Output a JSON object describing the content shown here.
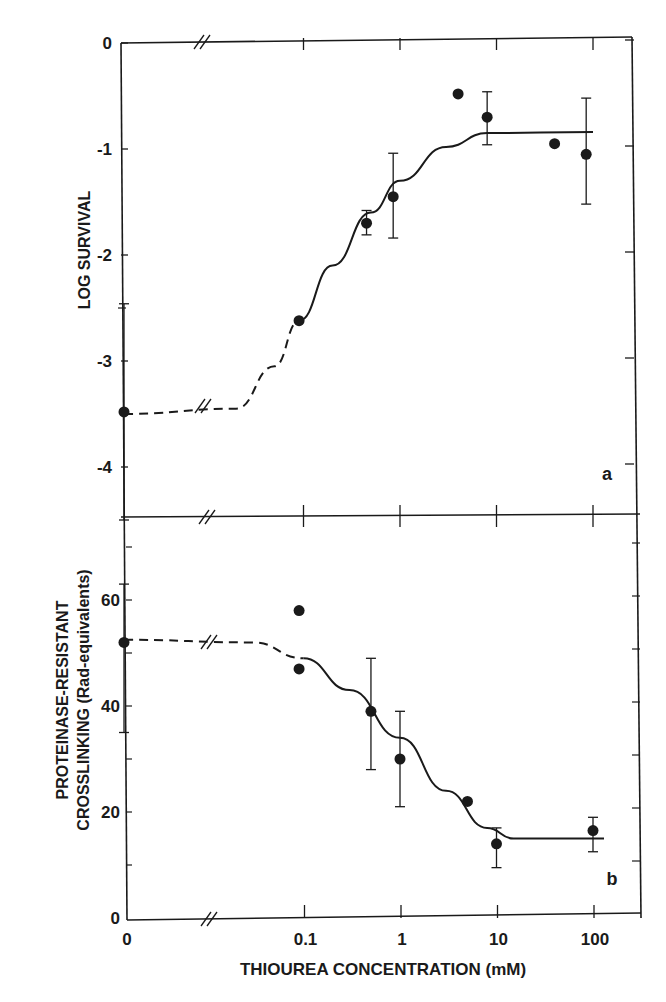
{
  "chart_data": [
    {
      "type": "scatter",
      "panel": "a",
      "title": "",
      "xlabel": "THIOUREA CONCENTRATION (mM)",
      "ylabel": "LOG SURVIVAL",
      "x_scale": "log with broken axis (0 shown separately)",
      "x_ticks": [
        "0",
        "0.1",
        "1",
        "10",
        "100"
      ],
      "y_ticks": [
        "0",
        "-1",
        "-2",
        "-3",
        "-4"
      ],
      "ylim": [
        -4.5,
        0
      ],
      "grid": false,
      "legend": null,
      "series": [
        {
          "name": "data",
          "points": [
            {
              "x": 0,
              "y": -3.48,
              "err_high": -2.46,
              "err_low": -4.5
            },
            {
              "x": 0.09,
              "y": -2.62
            },
            {
              "x": 0.45,
              "y": -1.7,
              "err_high": -1.58,
              "err_low": -1.81
            },
            {
              "x": 0.85,
              "y": -1.45,
              "err_high": -1.04,
              "err_low": -1.84
            },
            {
              "x": 4,
              "y": -0.48
            },
            {
              "x": 8,
              "y": -0.7,
              "err_high": -0.46,
              "err_low": -0.96
            },
            {
              "x": 40,
              "y": -0.95
            },
            {
              "x": 85,
              "y": -1.05,
              "err_high": -0.52,
              "err_low": -1.52
            }
          ]
        },
        {
          "name": "fit curve",
          "style": "dashed below x=0.09, solid above",
          "points": [
            {
              "x": 0,
              "y": -3.5
            },
            {
              "x": 0.02,
              "y": -3.45
            },
            {
              "x": 0.05,
              "y": -3.05
            },
            {
              "x": 0.09,
              "y": -2.62
            },
            {
              "x": 0.2,
              "y": -2.1
            },
            {
              "x": 0.5,
              "y": -1.6
            },
            {
              "x": 1,
              "y": -1.3
            },
            {
              "x": 3,
              "y": -0.98
            },
            {
              "x": 8,
              "y": -0.85
            },
            {
              "x": 100,
              "y": -0.84
            }
          ]
        }
      ],
      "annotations": [
        "a"
      ]
    },
    {
      "type": "scatter",
      "panel": "b",
      "title": "",
      "xlabel": "THIOUREA CONCENTRATION (mM)",
      "ylabel": "PROTEINASE-RESISTANT CROSSLINKING (Rad-equivalents)",
      "x_scale": "log with broken axis (0 shown separately)",
      "x_ticks": [
        "0",
        "0.1",
        "1",
        "10",
        "100"
      ],
      "y_ticks": [
        "0",
        "20",
        "40",
        "60"
      ],
      "ylim": [
        0,
        75
      ],
      "grid": false,
      "legend": null,
      "series": [
        {
          "name": "data",
          "points": [
            {
              "x": 0,
              "y": 52,
              "err_high": 63,
              "err_low": 35
            },
            {
              "x": 0.09,
              "y": 58
            },
            {
              "x": 0.09,
              "y": 47
            },
            {
              "x": 0.5,
              "y": 39,
              "err_high": 49,
              "err_low": 28
            },
            {
              "x": 1,
              "y": 30,
              "err_high": 39,
              "err_low": 21
            },
            {
              "x": 5,
              "y": 22
            },
            {
              "x": 10,
              "y": 14,
              "err_high": 17,
              "err_low": 9.5
            },
            {
              "x": 100,
              "y": 16.5,
              "err_high": 19,
              "err_low": 12.5
            }
          ]
        },
        {
          "name": "fit curve",
          "style": "dashed below x=0.1, solid above",
          "points": [
            {
              "x": 0,
              "y": 52.5
            },
            {
              "x": 0.03,
              "y": 52
            },
            {
              "x": 0.1,
              "y": 49
            },
            {
              "x": 0.3,
              "y": 43
            },
            {
              "x": 1,
              "y": 34
            },
            {
              "x": 3,
              "y": 24
            },
            {
              "x": 8,
              "y": 17
            },
            {
              "x": 15,
              "y": 15
            },
            {
              "x": 130,
              "y": 15
            }
          ]
        }
      ],
      "annotations": [
        "b"
      ]
    }
  ],
  "labels": {
    "top_ylabel": "LOG SURVIVAL",
    "bottom_ylabel_line1": "PROTEINASE-RESISTANT",
    "bottom_ylabel_line2": "CROSSLINKING (Rad-equivalents)",
    "xlabel": "THIOUREA CONCENTRATION (mM)",
    "panel_a": "a",
    "panel_b": "b",
    "x_ticks": [
      "0",
      "0.1",
      "1",
      "10",
      "100"
    ],
    "top_y_ticks": [
      "0",
      "-1",
      "-2",
      "-3",
      "-4"
    ],
    "bottom_y_ticks": [
      "0",
      "20",
      "40",
      "60"
    ]
  }
}
